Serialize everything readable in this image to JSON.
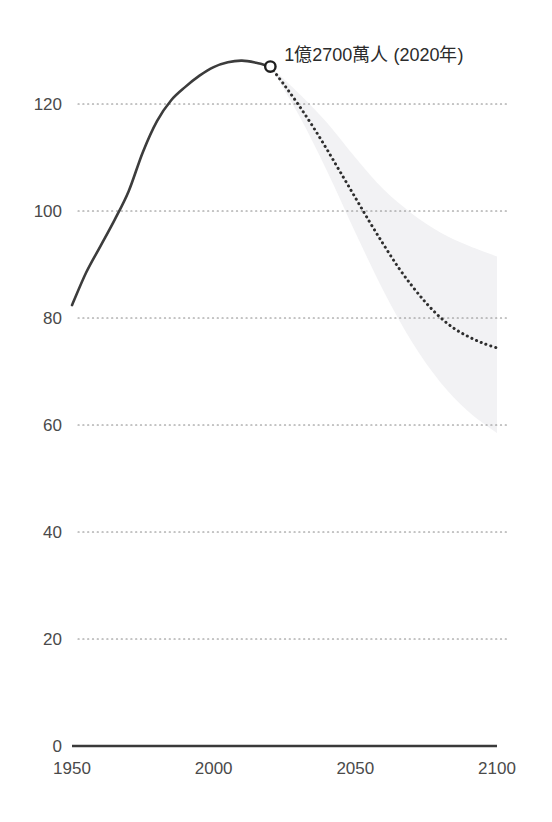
{
  "page": {
    "cut_title": "日本人口推移（億人）",
    "background_color": "#ffffff",
    "width": 552,
    "height": 822
  },
  "chart_data": {
    "type": "line",
    "title": "",
    "subtitle": "",
    "xlabel": "",
    "ylabel": "",
    "xlim": [
      1950,
      2100
    ],
    "ylim": [
      0,
      130
    ],
    "grid": true,
    "grid_axis": "y",
    "legend": "none",
    "x_ticks": [
      "1950",
      "2000",
      "2050",
      "2100"
    ],
    "x_tick_values": [
      1950,
      2000,
      2050,
      2100
    ],
    "y_ticks": [
      "0",
      "20",
      "40",
      "60",
      "80",
      "100",
      "120"
    ],
    "y_tick_values": [
      0,
      20,
      40,
      60,
      80,
      100,
      120
    ],
    "annotations": [
      {
        "text": "1億2700萬人 (2020年)",
        "x": 2020,
        "y": 127,
        "marker": "open-circle"
      }
    ],
    "series": [
      {
        "name": "historical",
        "style": "solid",
        "color": "#3c3c3c",
        "x": [
          1950,
          1955,
          1960,
          1965,
          1970,
          1975,
          1980,
          1985,
          1990,
          1995,
          2000,
          2005,
          2010,
          2015,
          2020
        ],
        "values": [
          82.4,
          88.5,
          93.4,
          98.3,
          103.7,
          111.0,
          116.8,
          120.7,
          123.2,
          125.3,
          126.9,
          127.8,
          128.1,
          127.7,
          127.0
        ]
      },
      {
        "name": "projection",
        "style": "dotted",
        "color": "#2e2e2e",
        "x": [
          2020,
          2025,
          2030,
          2035,
          2040,
          2045,
          2050,
          2055,
          2060,
          2065,
          2070,
          2075,
          2080,
          2085,
          2090,
          2095,
          2100
        ],
        "values": [
          127.0,
          123.5,
          119.8,
          115.8,
          111.5,
          107.0,
          102.5,
          98.0,
          93.7,
          89.6,
          86.0,
          82.8,
          80.1,
          78.0,
          76.5,
          75.3,
          74.4
        ]
      }
    ],
    "uncertainty_band": {
      "name": "projection-range",
      "color": "#f2f2f4",
      "x": [
        2020,
        2030,
        2040,
        2050,
        2060,
        2070,
        2080,
        2090,
        2100
      ],
      "upper": [
        127.0,
        122.0,
        116.5,
        110.0,
        104.0,
        99.5,
        96.0,
        93.5,
        91.5
      ],
      "lower": [
        127.0,
        118.0,
        107.5,
        96.0,
        85.0,
        75.5,
        68.0,
        62.5,
        58.5
      ]
    }
  }
}
